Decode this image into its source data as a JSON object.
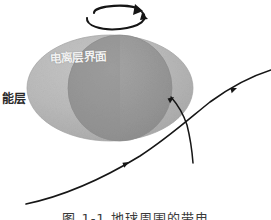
{
  "figure": {
    "type": "scientific-diagram",
    "background_color": "#ffffff",
    "rotation_indicator": {
      "icon": "rotation-arrow-icon",
      "description": "circular rotation arrow above the body indicating spin direction",
      "center_x": 113,
      "center_y": 14,
      "color": "#151515"
    },
    "body": {
      "name": "oblate-spheroid",
      "outer_ellipse": {
        "center_x": 110,
        "center_y": 88,
        "radius_x": 83,
        "radius_y": 53,
        "fill_color": "#b6b6b6",
        "edge_color": "#a2a2a2"
      },
      "inner_circle": {
        "name": "inner-core-circle",
        "center_x": 120,
        "center_y": 88,
        "radius_x": 52,
        "radius_y": 53,
        "fill_color": "#979797",
        "edge_color": "#8c8c8c"
      }
    },
    "labels": {
      "outer_layer": "能层",
      "inner_core": "电离层界面"
    },
    "trajectory": {
      "name": "trajectory-curve",
      "color": "#161616",
      "stroke_width": 1.6,
      "description": "particle path entering from lower left, bending upward to the right and branching at the body edge",
      "main_path": "M 26,204 C 64,196 104,178 140,156 C 168,138 190,118 210,102 C 232,86 252,76 270,70",
      "branch_path": "M 172,98 C 178,104 182,110 186,122 C 190,136 192,150 193,162",
      "arrowheads": [
        {
          "name": "arrowhead-lower",
          "x": 128,
          "y": 163,
          "angle": -32
        },
        {
          "name": "arrowhead-entry",
          "x": 173,
          "y": 98,
          "angle": -36
        },
        {
          "name": "arrowhead-upper",
          "x": 236,
          "y": 89,
          "angle": -22
        }
      ]
    },
    "caption": "图 1-1  地球周围的带电"
  },
  "colors": {
    "outer_shell": "#b6b6b6",
    "inner_core": "#979797",
    "line": "#161616",
    "label_dark": "#2a2a2a",
    "label_light": "#f2f2f2"
  }
}
